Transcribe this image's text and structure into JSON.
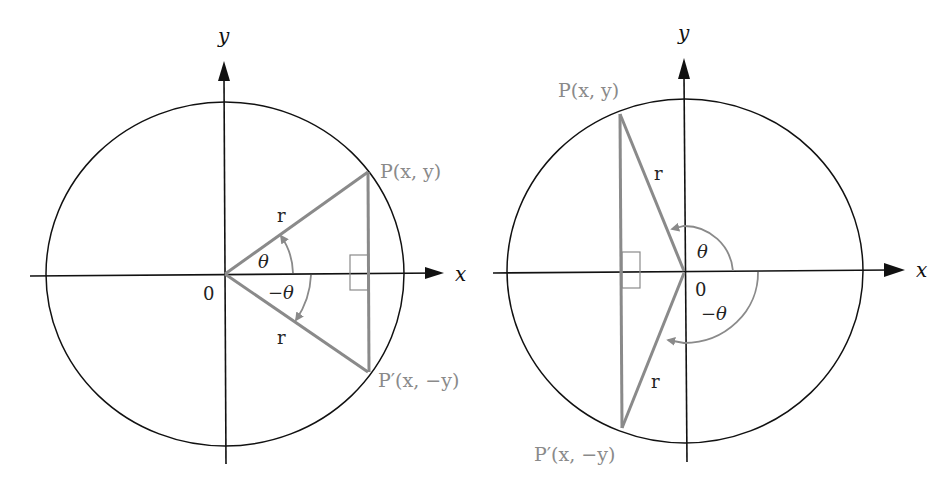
{
  "figures": [
    {
      "id": "left",
      "description": "Angle theta in first quadrant and its reflection -theta in fourth quadrant",
      "axis_labels": {
        "x": "x",
        "y": "y"
      },
      "origin_label": "0",
      "point_p": "P(x, y)",
      "point_p_prime": "P′(x, −y)",
      "radius_label_top": "r",
      "radius_label_bottom": "r",
      "angle_label": "θ",
      "neg_angle_label": "−θ"
    },
    {
      "id": "right",
      "description": "Angle theta in second quadrant and its reflection -theta in third quadrant",
      "axis_labels": {
        "x": "x",
        "y": "y"
      },
      "origin_label": "0",
      "point_p": "P(x, y)",
      "point_p_prime": "P′(x, −y)",
      "radius_label_top": "r",
      "radius_label_bottom": "r",
      "angle_label": "θ",
      "neg_angle_label": "−θ"
    }
  ],
  "colors": {
    "axis": "#111111",
    "circle": "#111111",
    "triangle": "#8a8a8a",
    "gray_text": "#8a8a8a"
  }
}
